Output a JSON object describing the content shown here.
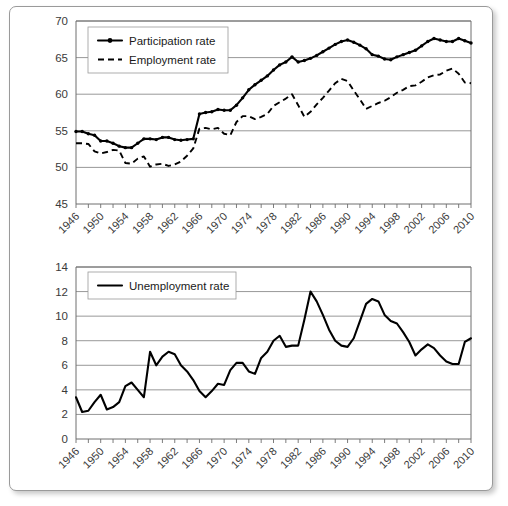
{
  "figure": {
    "panels": [
      "labour-force-participation-and-employment",
      "unemployment"
    ]
  },
  "chart_data": [
    {
      "type": "line",
      "title": "",
      "xlabel": "",
      "ylabel": "",
      "xlim": [
        1946,
        2010
      ],
      "ylim": [
        45,
        70
      ],
      "yticks": [
        45,
        50,
        55,
        60,
        65,
        70
      ],
      "xticks": [
        1946,
        1950,
        1954,
        1958,
        1962,
        1966,
        1970,
        1974,
        1978,
        1982,
        1986,
        1990,
        1994,
        1998,
        2002,
        2006,
        2010
      ],
      "grid": true,
      "legend_position": "top-left",
      "x": [
        1946,
        1947,
        1948,
        1949,
        1950,
        1951,
        1952,
        1953,
        1954,
        1955,
        1956,
        1957,
        1958,
        1959,
        1960,
        1961,
        1962,
        1963,
        1964,
        1965,
        1966,
        1967,
        1968,
        1969,
        1970,
        1971,
        1972,
        1973,
        1974,
        1975,
        1976,
        1977,
        1978,
        1979,
        1980,
        1981,
        1982,
        1983,
        1984,
        1985,
        1986,
        1987,
        1988,
        1989,
        1990,
        1991,
        1992,
        1993,
        1994,
        1995,
        1996,
        1997,
        1998,
        1999,
        2000,
        2001,
        2002,
        2003,
        2004,
        2005,
        2006,
        2007,
        2008,
        2009,
        2010
      ],
      "series": [
        {
          "name": "Participation rate",
          "style": "solid-with-markers",
          "values": [
            54.9,
            54.9,
            54.6,
            54.4,
            53.6,
            53.6,
            53.3,
            52.9,
            52.7,
            52.7,
            53.3,
            53.9,
            53.9,
            53.8,
            54.1,
            54.1,
            53.8,
            53.7,
            53.8,
            53.9,
            57.3,
            57.5,
            57.6,
            57.9,
            57.8,
            57.8,
            58.5,
            59.5,
            60.6,
            61.3,
            61.9,
            62.5,
            63.3,
            64.0,
            64.4,
            65.1,
            64.4,
            64.6,
            64.9,
            65.3,
            65.8,
            66.3,
            66.8,
            67.2,
            67.4,
            67.1,
            66.7,
            66.2,
            65.4,
            65.2,
            64.8,
            64.7,
            65.1,
            65.4,
            65.7,
            66.0,
            66.6,
            67.2,
            67.6,
            67.4,
            67.2,
            67.2,
            67.6,
            67.3,
            67.0
          ]
        },
        {
          "name": "Employment rate",
          "style": "dashed",
          "values": [
            53.3,
            53.3,
            53.2,
            52.2,
            51.9,
            52.1,
            52.4,
            52.3,
            50.6,
            50.5,
            51.2,
            51.5,
            50.1,
            50.4,
            50.5,
            50.2,
            50.4,
            50.8,
            51.6,
            52.6,
            55.3,
            55.4,
            55.2,
            55.4,
            54.6,
            54.4,
            56.2,
            57.0,
            57.0,
            56.6,
            56.9,
            57.3,
            58.4,
            58.9,
            59.4,
            60.0,
            58.5,
            56.9,
            57.6,
            58.6,
            59.5,
            60.5,
            61.5,
            62.1,
            61.8,
            60.5,
            59.3,
            58.0,
            58.4,
            58.8,
            59.1,
            59.6,
            60.2,
            60.6,
            61.1,
            61.2,
            61.7,
            62.3,
            62.6,
            62.7,
            63.2,
            63.5,
            62.8,
            61.6,
            61.5
          ]
        }
      ]
    },
    {
      "type": "line",
      "title": "",
      "xlabel": "",
      "ylabel": "",
      "xlim": [
        1946,
        2010
      ],
      "ylim": [
        0,
        14
      ],
      "yticks": [
        0,
        2,
        4,
        6,
        8,
        10,
        12,
        14
      ],
      "xticks": [
        1946,
        1950,
        1954,
        1958,
        1962,
        1966,
        1970,
        1974,
        1978,
        1982,
        1986,
        1990,
        1994,
        1998,
        2002,
        2006,
        2010
      ],
      "grid": true,
      "legend_position": "top-left",
      "x": [
        1946,
        1947,
        1948,
        1949,
        1950,
        1951,
        1952,
        1953,
        1954,
        1955,
        1956,
        1957,
        1958,
        1959,
        1960,
        1961,
        1962,
        1963,
        1964,
        1965,
        1966,
        1967,
        1968,
        1969,
        1970,
        1971,
        1972,
        1973,
        1974,
        1975,
        1976,
        1977,
        1978,
        1979,
        1980,
        1981,
        1982,
        1983,
        1984,
        1985,
        1986,
        1987,
        1988,
        1989,
        1990,
        1991,
        1992,
        1993,
        1994,
        1995,
        1996,
        1997,
        1998,
        1999,
        2000,
        2001,
        2002,
        2003,
        2004,
        2005,
        2006,
        2007,
        2008,
        2009,
        2010
      ],
      "series": [
        {
          "name": "Unemployment rate",
          "style": "solid",
          "values": [
            3.4,
            2.2,
            2.3,
            3.0,
            3.6,
            2.4,
            2.6,
            3.0,
            4.3,
            4.6,
            4.0,
            3.4,
            7.1,
            6.0,
            6.7,
            7.1,
            6.9,
            6.0,
            5.5,
            4.8,
            3.9,
            3.4,
            3.9,
            4.5,
            4.4,
            5.6,
            6.2,
            6.2,
            5.5,
            5.3,
            6.6,
            7.1,
            8.0,
            8.4,
            7.5,
            7.6,
            7.6,
            9.7,
            12.0,
            11.2,
            10.1,
            8.9,
            8.0,
            7.6,
            7.5,
            8.2,
            9.6,
            11.0,
            11.4,
            11.2,
            10.1,
            9.6,
            9.4,
            8.7,
            7.9,
            6.8,
            7.3,
            7.7,
            7.4,
            6.8,
            6.3,
            6.1,
            6.1,
            7.9,
            8.2
          ]
        }
      ]
    }
  ],
  "panel_top": {
    "name": "participation-employment-chart",
    "legend": [
      {
        "label": "Participation rate",
        "style": "solid-marker"
      },
      {
        "label": "Employment rate",
        "style": "dashed"
      }
    ],
    "ytick_labels": [
      "70",
      "65",
      "60",
      "55",
      "50",
      "45"
    ],
    "xtick_labels": [
      "1946",
      "1950",
      "1954",
      "1958",
      "1962",
      "1966",
      "1970",
      "1974",
      "1978",
      "1982",
      "1986",
      "1990",
      "1994",
      "1998",
      "2002",
      "2006",
      "2010"
    ]
  },
  "panel_bottom": {
    "name": "unemployment-chart",
    "legend": [
      {
        "label": "Unemployment rate",
        "style": "solid"
      }
    ],
    "ytick_labels": [
      "14",
      "12",
      "10",
      "8",
      "6",
      "4",
      "2",
      "0"
    ],
    "xtick_labels": [
      "1946",
      "1950",
      "1954",
      "1958",
      "1962",
      "1966",
      "1970",
      "1974",
      "1978",
      "1982",
      "1986",
      "1990",
      "1994",
      "1998",
      "2002",
      "2006",
      "2010"
    ]
  },
  "colors": {
    "line": "#000000",
    "grid": "#8c8c8c",
    "axis": "#6e6e6e",
    "text": "#3a3a3a",
    "frame": "#9a9a9a",
    "background": "#ffffff"
  }
}
